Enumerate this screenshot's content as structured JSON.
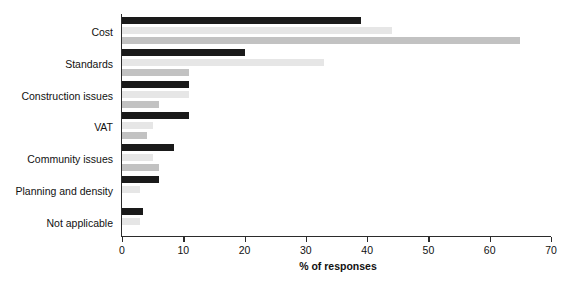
{
  "chart_data": {
    "type": "bar",
    "orientation": "horizontal",
    "title": "",
    "subtitle": "",
    "xlabel": "% of responses",
    "ylabel": "",
    "xlim": [
      0,
      70
    ],
    "xticks": [
      0,
      10,
      20,
      30,
      40,
      50,
      60,
      70
    ],
    "xtick_labels": [
      "0",
      "10",
      "20",
      "30",
      "40",
      "50",
      "60",
      "70"
    ],
    "grid": false,
    "legend": "none",
    "categories": [
      "Cost",
      "Standards",
      "Construction issues",
      "VAT",
      "Community issues",
      "Planning and density",
      "Not applicable"
    ],
    "series": [
      {
        "name": "Series 1",
        "color": "#1a1a1a",
        "values": [
          39,
          20,
          11,
          11,
          8.5,
          6,
          3.5
        ]
      },
      {
        "name": "Series 2",
        "color": "#e6e6e6",
        "values": [
          44,
          33,
          11,
          5,
          5,
          3,
          3
        ]
      },
      {
        "name": "Series 3",
        "color": "#c2c2c2",
        "values": [
          65,
          11,
          6,
          4,
          6,
          0,
          0
        ]
      }
    ]
  },
  "colors": {
    "series_1": "#1a1a1a",
    "series_2": "#e6e6e6",
    "series_3": "#c2c2c2",
    "axis": "#2b2b2b",
    "text": "#111111",
    "background": "#ffffff"
  }
}
